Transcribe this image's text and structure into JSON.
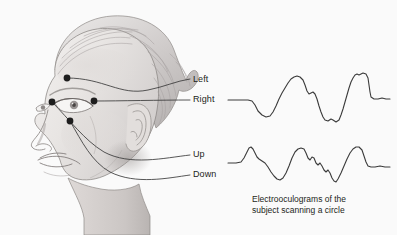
{
  "figure": {
    "type": "anatomical-diagram",
    "background_color": "#fafafa",
    "line_color": "#3a3a3a",
    "text_color": "#231f20"
  },
  "electrode_labels": [
    {
      "id": "left",
      "label": "Left",
      "x": 193,
      "y": 74
    },
    {
      "id": "right",
      "label": "Right",
      "x": 193,
      "y": 94
    },
    {
      "id": "up",
      "label": "Up",
      "x": 193,
      "y": 149
    },
    {
      "id": "down",
      "label": "Down",
      "x": 193,
      "y": 169
    }
  ],
  "electrodes": [
    {
      "id": "above-eye",
      "cx": 67,
      "cy": 78,
      "r": 3.4
    },
    {
      "id": "outer-canthus-left",
      "cx": 52,
      "cy": 102,
      "r": 3.4
    },
    {
      "id": "outer-canthus-right",
      "cx": 94,
      "cy": 101,
      "r": 3.4
    },
    {
      "id": "below-eye",
      "cx": 70,
      "cy": 121,
      "r": 3.4
    }
  ],
  "caption": {
    "text": "Electrooculograms of the\nsubject scanning a circle"
  },
  "chart_data": {
    "type": "line",
    "title": "Electrooculograms of the subject scanning a circle",
    "xlabel": "",
    "ylabel": "",
    "grid": false,
    "legend": "none",
    "series": [
      {
        "name": "horizontal-eog",
        "description": "Top trace — horizontal (left/right) eye movement",
        "points": [
          [
            228,
            100
          ],
          [
            240,
            100
          ],
          [
            248,
            100
          ],
          [
            252,
            101
          ],
          [
            255,
            105
          ],
          [
            258,
            111
          ],
          [
            262,
            115
          ],
          [
            266,
            117
          ],
          [
            270,
            116
          ],
          [
            273,
            112
          ],
          [
            276,
            106
          ],
          [
            279,
            99
          ],
          [
            282,
            93
          ],
          [
            285,
            88
          ],
          [
            288,
            83
          ],
          [
            291,
            79
          ],
          [
            294,
            77
          ],
          [
            297,
            76
          ],
          [
            300,
            77
          ],
          [
            303,
            80
          ],
          [
            305,
            85
          ],
          [
            307,
            91
          ],
          [
            309,
            94
          ],
          [
            311,
            93
          ],
          [
            313,
            92
          ],
          [
            315,
            94
          ],
          [
            317,
            99
          ],
          [
            319,
            106
          ],
          [
            321,
            112
          ],
          [
            323,
            117
          ],
          [
            325,
            120
          ],
          [
            328,
            121
          ],
          [
            331,
            119
          ],
          [
            333,
            120
          ],
          [
            336,
            122
          ],
          [
            339,
            120
          ],
          [
            341,
            115
          ],
          [
            343,
            109
          ],
          [
            345,
            102
          ],
          [
            347,
            95
          ],
          [
            349,
            88
          ],
          [
            351,
            82
          ],
          [
            353,
            78
          ],
          [
            355,
            75
          ],
          [
            357,
            74
          ],
          [
            359,
            75
          ],
          [
            361,
            74
          ],
          [
            363,
            73
          ],
          [
            366,
            74
          ],
          [
            368,
            78
          ],
          [
            369,
            85
          ],
          [
            370,
            92
          ],
          [
            371,
            97
          ],
          [
            374,
            99
          ],
          [
            378,
            99
          ],
          [
            382,
            98
          ],
          [
            386,
            99
          ],
          [
            390,
            99
          ]
        ]
      },
      {
        "name": "vertical-eog",
        "description": "Bottom trace — vertical (up/down) eye movement",
        "points": [
          [
            228,
            163
          ],
          [
            236,
            163
          ],
          [
            241,
            162
          ],
          [
            244,
            158
          ],
          [
            247,
            152
          ],
          [
            249,
            148
          ],
          [
            251,
            147
          ],
          [
            253,
            149
          ],
          [
            255,
            153
          ],
          [
            257,
            157
          ],
          [
            259,
            159
          ],
          [
            262,
            161
          ],
          [
            265,
            163
          ],
          [
            268,
            167
          ],
          [
            271,
            172
          ],
          [
            274,
            176
          ],
          [
            277,
            179
          ],
          [
            280,
            180
          ],
          [
            283,
            178
          ],
          [
            286,
            173
          ],
          [
            289,
            166
          ],
          [
            292,
            158
          ],
          [
            295,
            152
          ],
          [
            298,
            149
          ],
          [
            301,
            148
          ],
          [
            304,
            149
          ],
          [
            306,
            153
          ],
          [
            308,
            158
          ],
          [
            310,
            160
          ],
          [
            312,
            157
          ],
          [
            314,
            158
          ],
          [
            316,
            163
          ],
          [
            318,
            165
          ],
          [
            320,
            163
          ],
          [
            322,
            166
          ],
          [
            324,
            170
          ],
          [
            326,
            172
          ],
          [
            328,
            170
          ],
          [
            330,
            173
          ],
          [
            332,
            178
          ],
          [
            334,
            181
          ],
          [
            336,
            182
          ],
          [
            338,
            179
          ],
          [
            341,
            173
          ],
          [
            344,
            166
          ],
          [
            347,
            159
          ],
          [
            350,
            153
          ],
          [
            353,
            149
          ],
          [
            356,
            147
          ],
          [
            359,
            147
          ],
          [
            362,
            150
          ],
          [
            364,
            156
          ],
          [
            366,
            162
          ],
          [
            368,
            166
          ],
          [
            371,
            167
          ],
          [
            375,
            167
          ],
          [
            380,
            166
          ],
          [
            385,
            167
          ],
          [
            390,
            167
          ]
        ]
      }
    ]
  }
}
